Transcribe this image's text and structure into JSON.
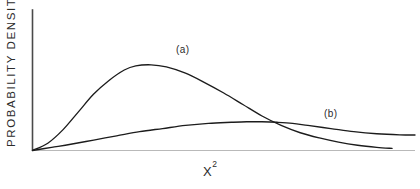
{
  "chart_data": {
    "type": "line",
    "title": "",
    "subtitle": "",
    "xlabel_base": "X",
    "xlabel_exponent": "2",
    "xlabel": "X²",
    "ylabel": "PROBABILITY  DENSITY",
    "grid": false,
    "legend_position": "inline-annotation",
    "axis_ticks": false,
    "tick_labels": {
      "x": [],
      "y": []
    },
    "xlim": [
      0,
      1
    ],
    "ylim": [
      0,
      1
    ],
    "annotations": [
      {
        "text": "(a)",
        "x_px": 181,
        "y_px": 50
      },
      {
        "text": "(b)",
        "x_px": 329,
        "y_px": 114
      }
    ],
    "series": [
      {
        "name": "(a)",
        "label": "(a)",
        "color": "#1c1c1c",
        "description": "Skewed unimodal probability density with a pronounced peak at low X² and a long right tail.",
        "x": [
          0.0,
          0.04,
          0.08,
          0.12,
          0.16,
          0.2,
          0.24,
          0.27,
          0.31,
          0.35,
          0.4,
          0.45,
          0.5,
          0.55,
          0.6,
          0.65,
          0.7,
          0.75,
          0.8,
          0.85,
          0.9,
          0.94
        ],
        "y": [
          0.0,
          0.07,
          0.2,
          0.37,
          0.54,
          0.67,
          0.77,
          0.81,
          0.82,
          0.8,
          0.74,
          0.65,
          0.55,
          0.44,
          0.33,
          0.24,
          0.17,
          0.12,
          0.08,
          0.05,
          0.03,
          0.02
        ]
      },
      {
        "name": "(b)",
        "label": "(b)",
        "color": "#1c1c1c",
        "description": "Broad, flat low-amplitude density rising gradually to a wide plateau at high X².",
        "x": [
          0.0,
          0.05,
          0.1,
          0.16,
          0.22,
          0.28,
          0.34,
          0.4,
          0.46,
          0.52,
          0.56,
          0.6,
          0.64,
          0.68,
          0.72,
          0.78,
          0.84,
          0.9,
          0.96,
          1.0
        ],
        "y": [
          0.0,
          0.03,
          0.06,
          0.1,
          0.14,
          0.18,
          0.21,
          0.24,
          0.26,
          0.27,
          0.275,
          0.275,
          0.27,
          0.26,
          0.24,
          0.21,
          0.18,
          0.16,
          0.15,
          0.148
        ]
      }
    ],
    "crossing_point": {
      "x": 0.535,
      "y": 0.27
    }
  },
  "figure": {
    "background_color": "#ffffff",
    "axis_color": "#4a4a4a",
    "baseline_color": "#b9b9b9",
    "curve_color": "#1c1c1c"
  }
}
